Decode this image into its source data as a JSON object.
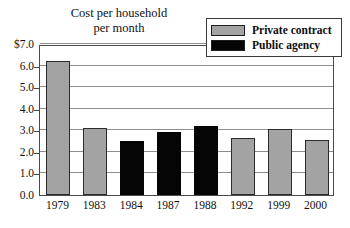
{
  "chart_data": {
    "type": "bar",
    "title": "Cost per household per month",
    "title_lines": [
      "Cost per household",
      "per month"
    ],
    "xlabel": "",
    "ylabel": "",
    "categories": [
      "1979",
      "1983",
      "1984",
      "1987",
      "1988",
      "1992",
      "1999",
      "2000"
    ],
    "values": [
      6.2,
      3.1,
      2.5,
      2.93,
      3.2,
      2.63,
      3.05,
      2.53
    ],
    "bar_groups": [
      "Private contract",
      "Private contract",
      "Public agency",
      "Public agency",
      "Public agency",
      "Private contract",
      "Private contract",
      "Private contract"
    ],
    "series": [
      {
        "name": "Private contract",
        "color": "#a3a3a3",
        "points": [
          {
            "category": "1979",
            "value": 6.2
          },
          {
            "category": "1983",
            "value": 3.1
          },
          {
            "category": "1992",
            "value": 2.63
          },
          {
            "category": "1999",
            "value": 3.05
          },
          {
            "category": "2000",
            "value": 2.53
          }
        ]
      },
      {
        "name": "Public agency",
        "color": "#050505",
        "points": [
          {
            "category": "1984",
            "value": 2.5
          },
          {
            "category": "1987",
            "value": 2.93
          },
          {
            "category": "1988",
            "value": 3.2
          }
        ]
      }
    ],
    "ylim": [
      0,
      7
    ],
    "ytick_values": [
      7,
      6,
      5,
      4,
      3,
      2,
      1,
      0
    ],
    "ytick_labels": [
      "$7.0",
      "6.0",
      "5.0",
      "4.0",
      "3.0",
      "2.0",
      "1.0",
      "0.0"
    ],
    "grid": true,
    "grid_axis": "y",
    "legend_position": "top-right",
    "legend": [
      {
        "label": "Private contract",
        "color": "#a3a3a3",
        "swatch": "gray-swatch"
      },
      {
        "label": "Public agency",
        "color": "#050505",
        "swatch": "black-swatch"
      }
    ]
  },
  "colors": {
    "private_contract": "#a3a3a3",
    "public_agency": "#050505",
    "gridline": "#8d8d8d",
    "frame": "#4a4a4a",
    "background": "#ffffff",
    "text": "#111111"
  }
}
